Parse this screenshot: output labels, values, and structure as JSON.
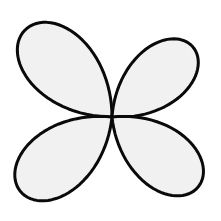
{
  "figure": {
    "name": "four-petal-rose-curve",
    "canvas": {
      "width": 221,
      "height": 221,
      "background_color": "#ffffff"
    },
    "center": {
      "x": 112,
      "y": 117
    },
    "style": {
      "fill_color": "#f1f1f1",
      "stroke_color": "#0a0a0a",
      "stroke_width": 3
    },
    "curve_type": "rose-petal r = L*cos(2u), u in [-45deg, 45deg]",
    "petals": [
      {
        "name": "upper-left",
        "angle_deg": 135,
        "length": 123
      },
      {
        "name": "upper-right",
        "angle_deg": 41,
        "length": 107
      },
      {
        "name": "lower-left",
        "angle_deg": 219,
        "length": 118
      },
      {
        "name": "lower-right",
        "angle_deg": 321,
        "length": 111
      }
    ]
  }
}
